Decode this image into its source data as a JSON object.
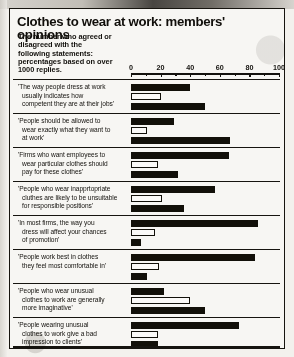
{
  "header": {
    "title": "Clothes to wear at work: members' opinions",
    "subtitle_lines": [
      "The number who agreed or",
      "disagreed with the",
      "following statements:",
      "percentages based on over",
      "1000 replies."
    ]
  },
  "chart_data": {
    "type": "bar",
    "orientation": "horizontal",
    "title": "Clothes to wear at work: members' opinions",
    "subtitle": "The number who agreed or disagreed with the following statements: percentages based on over 1000 replies.",
    "xlabel": "",
    "ylabel": "",
    "xlim": [
      0,
      100
    ],
    "xticks": [
      0,
      20,
      40,
      60,
      80,
      100
    ],
    "xtick_labels": [
      "0",
      "20",
      "40",
      "60",
      "80",
      "100"
    ],
    "minor_tick_step": 10,
    "grid": false,
    "legend_position": "none",
    "series": [
      {
        "name": "bar-1",
        "style": "solid",
        "values": [
          40,
          29,
          66,
          57,
          86,
          84,
          22,
          73
        ]
      },
      {
        "name": "bar-2",
        "style": "hollow",
        "values": [
          20,
          11,
          18,
          21,
          16,
          19,
          40,
          18
        ]
      },
      {
        "name": "bar-3",
        "style": "solid",
        "values": [
          50,
          67,
          32,
          36,
          7,
          11,
          50,
          18
        ]
      }
    ],
    "categories": [
      "'The way people dress at work usually indicates how competent they are at their jobs'",
      "'People should be allowed to wear exactly what they want to at work'",
      "'Firms who want employees to wear particular clothes should pay for these clothes'",
      "'People who wear inapprtopriate cluthes are likely to be unsuitable for responsible positions'",
      "'In most firms, the way you dress will affect your chances of promotion'",
      "'People work best in clothes they feel most comfortable in'",
      "'People who wear unusual clothes to work are generally more imaginative'",
      "'People wearing unusual clothes to work give a bad impression to clients'"
    ]
  },
  "rows": [
    {
      "lines": [
        "'The way people dress at work",
        "usually indicates how",
        "competent they are at their jobs'"
      ],
      "bars": [
        {
          "value": 40,
          "style": "solid"
        },
        {
          "value": 20,
          "style": "hollow"
        },
        {
          "value": 50,
          "style": "solid"
        }
      ]
    },
    {
      "lines": [
        "'People should be allowed to",
        "wear exactly what they want to",
        "at work'"
      ],
      "bars": [
        {
          "value": 29,
          "style": "solid"
        },
        {
          "value": 11,
          "style": "hollow"
        },
        {
          "value": 67,
          "style": "solid"
        }
      ]
    },
    {
      "lines": [
        "'Firms who want employees to",
        "wear particular clothes should",
        "pay for these clothes'"
      ],
      "bars": [
        {
          "value": 66,
          "style": "solid"
        },
        {
          "value": 18,
          "style": "hollow"
        },
        {
          "value": 32,
          "style": "solid"
        }
      ]
    },
    {
      "lines": [
        "'People who wear inapprtopriate",
        "cluthes are likely to be unsuitable",
        "for responsible positions'"
      ],
      "bars": [
        {
          "value": 57,
          "style": "solid"
        },
        {
          "value": 21,
          "style": "hollow"
        },
        {
          "value": 36,
          "style": "solid"
        }
      ]
    },
    {
      "lines": [
        "'In most firms, the way you",
        "dress will affect your chances",
        "of promotion'"
      ],
      "bars": [
        {
          "value": 86,
          "style": "solid"
        },
        {
          "value": 16,
          "style": "hollow"
        },
        {
          "value": 7,
          "style": "solid"
        }
      ]
    },
    {
      "lines": [
        "'People work best in clothes",
        "they feel most comfortable in'",
        ""
      ],
      "bars": [
        {
          "value": 84,
          "style": "solid"
        },
        {
          "value": 19,
          "style": "hollow"
        },
        {
          "value": 11,
          "style": "solid"
        }
      ]
    },
    {
      "lines": [
        "'People who wear unusual",
        "clothes to work are generally",
        "more imaginative'"
      ],
      "bars": [
        {
          "value": 22,
          "style": "solid"
        },
        {
          "value": 40,
          "style": "hollow"
        },
        {
          "value": 50,
          "style": "solid"
        }
      ]
    },
    {
      "lines": [
        "'People wearing unusual",
        "clothes to work give a bad",
        "impression to clients'"
      ],
      "bars": [
        {
          "value": 73,
          "style": "solid"
        },
        {
          "value": 18,
          "style": "hollow"
        },
        {
          "value": 18,
          "style": "solid"
        }
      ]
    }
  ]
}
